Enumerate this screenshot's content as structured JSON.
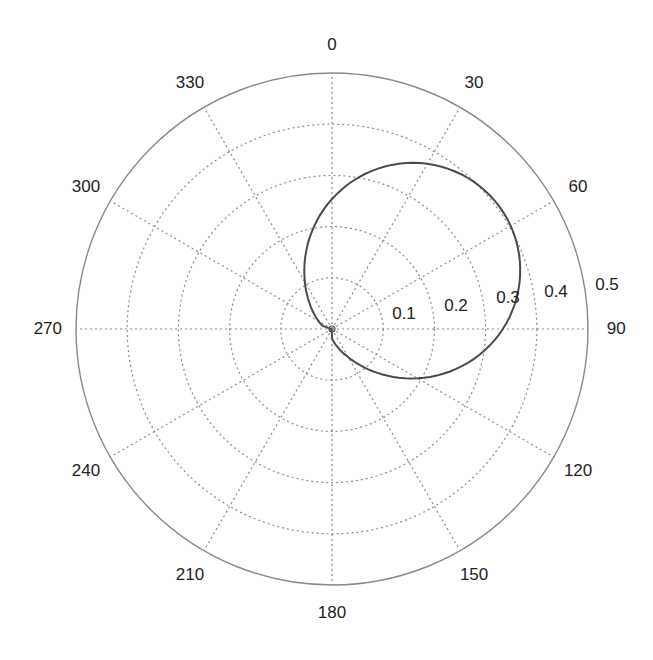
{
  "chart_data": {
    "type": "line",
    "projection": "polar",
    "title": "",
    "theta_direction": "clockwise",
    "theta_zero_location": "N",
    "theta_tick_labels": [
      "0",
      "30",
      "60",
      "90",
      "120",
      "150",
      "180",
      "210",
      "240",
      "270",
      "300",
      "330"
    ],
    "theta_ticks_deg": [
      0,
      30,
      60,
      90,
      120,
      150,
      180,
      210,
      240,
      270,
      300,
      330
    ],
    "r_tick_labels": [
      "0.1",
      "0.2",
      "0.3",
      "0.4",
      "0.5"
    ],
    "r_ticks": [
      0.1,
      0.2,
      0.3,
      0.4,
      0.5
    ],
    "rlim": [
      0,
      0.5
    ],
    "grid": true,
    "series": [
      {
        "name": "pattern",
        "description": "cardioid-like lobe pointing toward ~54 deg",
        "theta_deg": [
          0,
          15,
          30,
          45,
          54,
          60,
          75,
          90,
          105,
          120,
          135,
          150,
          165,
          180,
          210,
          240,
          270,
          300,
          330,
          345
        ],
        "r": [
          0.33,
          0.37,
          0.4,
          0.415,
          0.42,
          0.415,
          0.4,
          0.36,
          0.3,
          0.24,
          0.17,
          0.1,
          0.05,
          0.02,
          0.003,
          0.0,
          0.02,
          0.08,
          0.19,
          0.26
        ],
        "color": "#444444"
      }
    ]
  },
  "colors": {
    "curve": "#4a4a4a",
    "outer": "#8a8a8a",
    "grid": "#8c8c8c",
    "text": "#222222"
  }
}
